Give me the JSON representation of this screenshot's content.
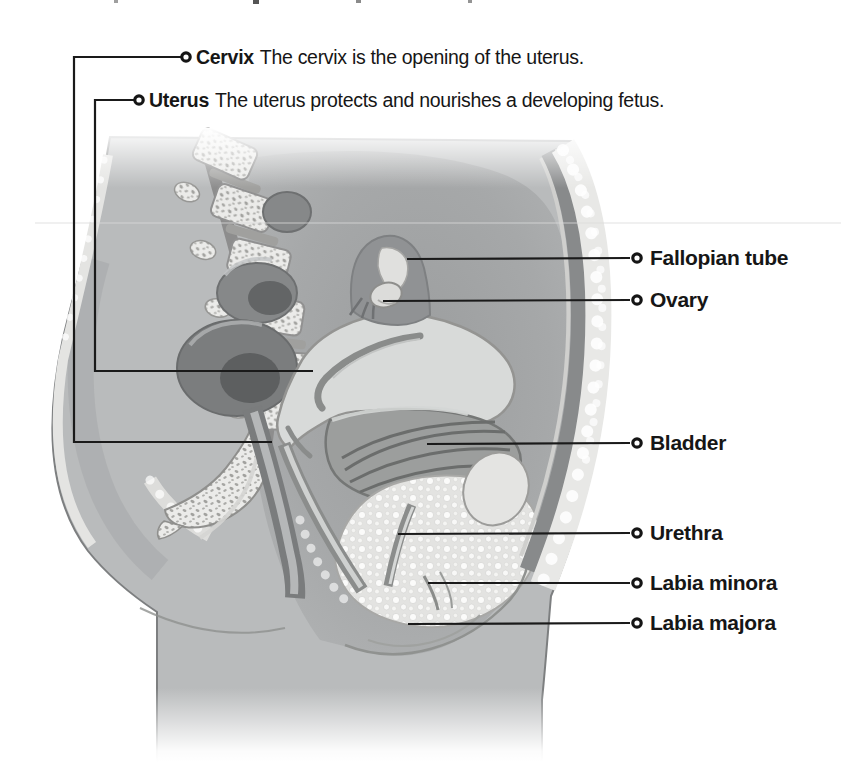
{
  "figure": {
    "background_color": "#ffffff",
    "text_color": "#161616",
    "callout_line_color": "#1a1a1a",
    "labels_top": [
      {
        "term": "Cervix",
        "description": "The cervix is the opening of the uterus."
      },
      {
        "term": "Uterus",
        "description": "The uterus protects and nourishes a developing fetus."
      }
    ],
    "labels_right": [
      {
        "term": "Fallopian tube"
      },
      {
        "term": "Ovary"
      },
      {
        "term": "Bladder"
      },
      {
        "term": "Urethra"
      },
      {
        "term": "Labia minora"
      },
      {
        "term": "Labia majora"
      }
    ],
    "illustration": {
      "description": "Grayscale side (sagittal) cross-section of the female pelvis showing the spine, uterus, bladder and external genitalia",
      "palette": {
        "body": "#b9bbbc",
        "cavity": "#a4a6a7",
        "organ_light": "#d8dad9",
        "organ_dark": "#7e8082",
        "bone_stipple": "#ebebe9",
        "fat_bubble": "#e3e3e1",
        "outline": "#7d7f80"
      }
    }
  }
}
